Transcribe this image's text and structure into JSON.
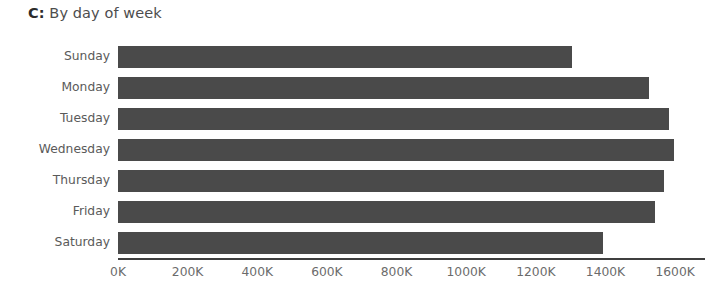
{
  "chart_data": {
    "type": "bar",
    "orientation": "horizontal",
    "title": "C: By day of week",
    "panel_letter": "C:",
    "title_rest": " By day of week",
    "xlabel": "",
    "ylabel": "",
    "categories": [
      "Sunday",
      "Monday",
      "Tuesday",
      "Wednesday",
      "Thursday",
      "Friday",
      "Saturday"
    ],
    "values": [
      1303000,
      1526000,
      1581000,
      1598000,
      1567000,
      1541000,
      1392000
    ],
    "value_unit": "count",
    "xlim": [
      0,
      1680000
    ],
    "ylim_note": "categorical, 7 bands",
    "xticks": [
      0,
      200000,
      400000,
      600000,
      800000,
      1000000,
      1200000,
      1400000,
      1600000
    ],
    "xticklabels": [
      "0K",
      "200K",
      "400K",
      "600K",
      "800K",
      "1000K",
      "1200K",
      "1400K",
      "1600K"
    ],
    "grid": false,
    "legend": false,
    "legend_position": "none",
    "bar_color": "#4a4a4a",
    "axis_color": "#3f3f3f",
    "tick_label_color": "#6b6b6b",
    "category_label_color": "#5a5a5a",
    "background_color": "#ffffff"
  }
}
